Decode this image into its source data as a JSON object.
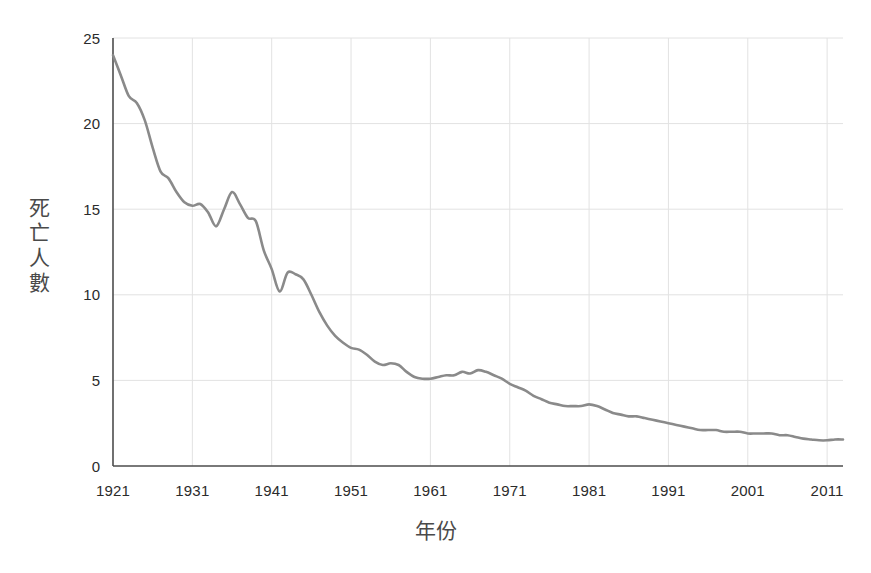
{
  "chart_data": {
    "type": "line",
    "title": "",
    "xlabel": "年份",
    "ylabel": "死亡人數",
    "ylabel_chars": [
      "死",
      "亡",
      "人",
      "數"
    ],
    "xlim": [
      1921,
      2013
    ],
    "ylim": [
      0,
      25
    ],
    "grid": true,
    "legend": null,
    "x_ticks": [
      1921,
      1931,
      1941,
      1951,
      1961,
      1971,
      1981,
      1991,
      2001,
      2011
    ],
    "x_tick_labels": [
      "1921",
      "1931",
      "1941",
      "1951",
      "1961",
      "1971",
      "1981",
      "1991",
      "2001",
      "2011"
    ],
    "y_ticks": [
      0,
      5,
      10,
      15,
      20,
      25
    ],
    "y_tick_labels": [
      "0",
      "5",
      "10",
      "15",
      "20",
      "25"
    ],
    "line_color": "#8a8a8a",
    "line_width": 2.6,
    "axis_color": "#4d4d4d",
    "grid_color": "#e2e2e2",
    "series": [
      {
        "name": "死亡人數",
        "x": [
          1921,
          1922,
          1923,
          1924,
          1925,
          1926,
          1927,
          1928,
          1929,
          1930,
          1931,
          1932,
          1933,
          1934,
          1935,
          1936,
          1937,
          1938,
          1939,
          1940,
          1941,
          1942,
          1943,
          1944,
          1945,
          1946,
          1947,
          1948,
          1949,
          1950,
          1951,
          1952,
          1953,
          1954,
          1955,
          1956,
          1957,
          1958,
          1959,
          1960,
          1961,
          1962,
          1963,
          1964,
          1965,
          1966,
          1967,
          1968,
          1969,
          1970,
          1971,
          1972,
          1973,
          1974,
          1975,
          1976,
          1977,
          1978,
          1979,
          1980,
          1981,
          1982,
          1983,
          1984,
          1985,
          1986,
          1987,
          1988,
          1989,
          1990,
          1991,
          1992,
          1993,
          1994,
          1995,
          1996,
          1997,
          1998,
          1999,
          2000,
          2001,
          2002,
          2003,
          2004,
          2005,
          2006,
          2007,
          2008,
          2009,
          2010,
          2011,
          2012,
          2013
        ],
        "values": [
          24.0,
          22.8,
          21.6,
          21.2,
          20.2,
          18.6,
          17.2,
          16.8,
          16.0,
          15.4,
          15.2,
          15.3,
          14.8,
          14.0,
          15.0,
          16.0,
          15.3,
          14.5,
          14.3,
          12.6,
          11.5,
          10.2,
          11.3,
          11.2,
          10.9,
          10.0,
          9.0,
          8.2,
          7.6,
          7.2,
          6.9,
          6.8,
          6.5,
          6.1,
          5.9,
          6.0,
          5.9,
          5.5,
          5.2,
          5.1,
          5.1,
          5.2,
          5.3,
          5.3,
          5.5,
          5.4,
          5.6,
          5.5,
          5.3,
          5.1,
          4.8,
          4.6,
          4.4,
          4.1,
          3.9,
          3.7,
          3.6,
          3.5,
          3.5,
          3.5,
          3.6,
          3.5,
          3.3,
          3.1,
          3.0,
          2.9,
          2.9,
          2.8,
          2.7,
          2.6,
          2.5,
          2.4,
          2.3,
          2.2,
          2.1,
          2.1,
          2.1,
          2.0,
          2.0,
          2.0,
          1.9,
          1.9,
          1.9,
          1.9,
          1.8,
          1.8,
          1.7,
          1.6,
          1.55,
          1.5,
          1.5,
          1.55,
          1.55
        ]
      }
    ]
  },
  "plot_geometry": {
    "left": 113,
    "right": 843,
    "top": 38,
    "bottom": 466
  }
}
